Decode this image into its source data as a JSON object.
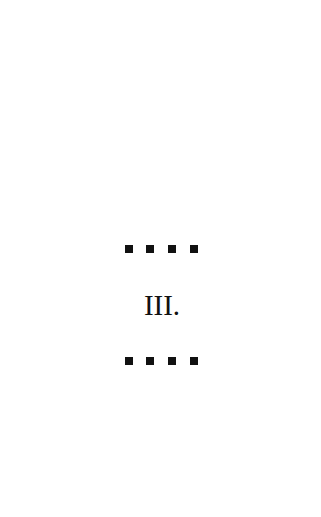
{
  "page": {
    "chapter_numeral": "III.",
    "ornament_top": {
      "icon": "square-dots-ornament",
      "count": 4
    },
    "ornament_bottom": {
      "icon": "square-dots-ornament",
      "count": 4
    },
    "colors": {
      "background": "#ffffff",
      "ink": "#111111"
    }
  }
}
